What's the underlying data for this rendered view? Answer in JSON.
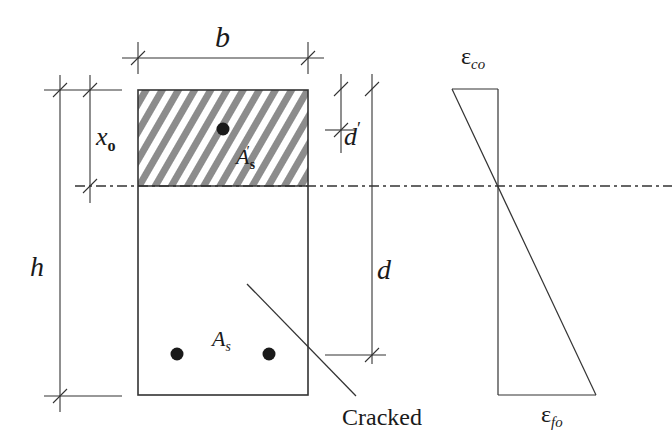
{
  "diagram": {
    "colors": {
      "line": "#333333",
      "hatch": "#8c8c8c",
      "rebar": "#1a1a1a",
      "background": "#ffffff"
    },
    "labels": {
      "width": "b",
      "height": "h",
      "neutral_axis_depth_main": "x",
      "neutral_axis_depth_sub": "o",
      "comp_cover_main": "d",
      "comp_cover_prime": "′",
      "effective_depth": "d",
      "comp_steel_main": "A",
      "comp_steel_prime": "′",
      "comp_steel_sub": "s",
      "tension_steel_main": "A",
      "tension_steel_sub": "s",
      "crack_label": "Cracked",
      "strain_top_main": "ε",
      "strain_top_sub": "co",
      "strain_bottom_main": "ε",
      "strain_bottom_sub": "fo"
    },
    "section": {
      "compression_zone": "hatched",
      "rebars_top": 1,
      "rebars_bottom": 2
    }
  }
}
